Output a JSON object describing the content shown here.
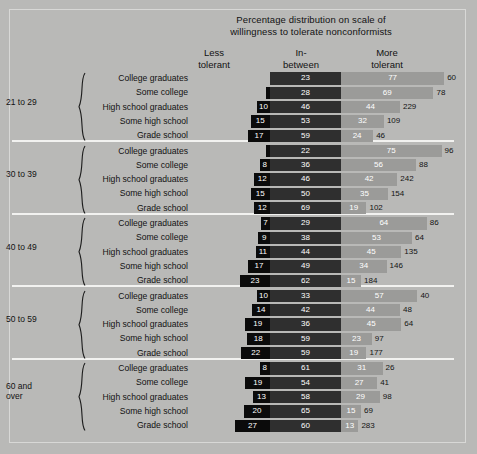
{
  "header": {
    "title_line1": "Percentage distribution on scale of",
    "title_line2": "willingness to tolerate nonconformists",
    "col_less_line1": "Less",
    "col_less_line2": "tolerant",
    "col_mid_line1": "In-",
    "col_mid_line2": "between",
    "col_more_line1": "More",
    "col_more_line2": "tolerant"
  },
  "colors": {
    "panel": "#b9b9b7",
    "less_tolerant": "#0b0b0b",
    "in_between": "#2f2f2f",
    "more_tolerant": "#9b9b99",
    "rule": "#f2f2f0"
  },
  "chart_data": {
    "type": "bar",
    "title": "Percentage distribution on scale of willingness to tolerate nonconformists",
    "xlabel": "",
    "ylabel": "",
    "grid": false,
    "legend_position": "top",
    "series": [
      {
        "name": "Less tolerant"
      },
      {
        "name": "In-between"
      },
      {
        "name": "More tolerant"
      }
    ],
    "groups": [
      {
        "age": "21 to 29",
        "age_line2": "",
        "rows": [
          {
            "education": "College graduates",
            "less": 0,
            "mid": 23,
            "more": 77,
            "n": 60,
            "less_label": ""
          },
          {
            "education": "Some college",
            "less": 3,
            "mid": 28,
            "more": 69,
            "n": 78,
            "less_label": ""
          },
          {
            "education": "High school graduates",
            "less": 10,
            "mid": 46,
            "more": 44,
            "n": 229,
            "less_label": "10"
          },
          {
            "education": "Some high school",
            "less": 15,
            "mid": 53,
            "more": 32,
            "n": 109,
            "less_label": "15"
          },
          {
            "education": "Grade school",
            "less": 17,
            "mid": 59,
            "more": 24,
            "n": 46,
            "less_label": "17"
          }
        ]
      },
      {
        "age": "30 to 39",
        "age_line2": "",
        "rows": [
          {
            "education": "College graduates",
            "less": 3,
            "mid": 22,
            "more": 75,
            "n": 96,
            "less_label": ""
          },
          {
            "education": "Some college",
            "less": 8,
            "mid": 36,
            "more": 56,
            "n": 88,
            "less_label": "8"
          },
          {
            "education": "High school graduates",
            "less": 12,
            "mid": 46,
            "more": 42,
            "n": 242,
            "less_label": "12"
          },
          {
            "education": "Some high school",
            "less": 15,
            "mid": 50,
            "more": 35,
            "n": 154,
            "less_label": "15"
          },
          {
            "education": "Grade school",
            "less": 12,
            "mid": 69,
            "more": 19,
            "n": 102,
            "less_label": "12"
          }
        ]
      },
      {
        "age": "40 to 49",
        "age_line2": "",
        "rows": [
          {
            "education": "College graduates",
            "less": 7,
            "mid": 29,
            "more": 64,
            "n": 86,
            "less_label": "7"
          },
          {
            "education": "Some college",
            "less": 9,
            "mid": 38,
            "more": 53,
            "n": 64,
            "less_label": "9"
          },
          {
            "education": "High school graduates",
            "less": 11,
            "mid": 44,
            "more": 45,
            "n": 135,
            "less_label": "11"
          },
          {
            "education": "Some high school",
            "less": 17,
            "mid": 49,
            "more": 34,
            "n": 146,
            "less_label": "17"
          },
          {
            "education": "Grade school",
            "less": 23,
            "mid": 62,
            "more": 15,
            "n": 184,
            "less_label": "23"
          }
        ]
      },
      {
        "age": "50 to 59",
        "age_line2": "",
        "rows": [
          {
            "education": "College graduates",
            "less": 10,
            "mid": 33,
            "more": 57,
            "n": 40,
            "less_label": "10"
          },
          {
            "education": "Some college",
            "less": 14,
            "mid": 42,
            "more": 44,
            "n": 48,
            "less_label": "14"
          },
          {
            "education": "High school graduates",
            "less": 19,
            "mid": 36,
            "more": 45,
            "n": 64,
            "less_label": "19"
          },
          {
            "education": "Some high school",
            "less": 18,
            "mid": 59,
            "more": 23,
            "n": 97,
            "less_label": "18"
          },
          {
            "education": "Grade school",
            "less": 22,
            "mid": 59,
            "more": 19,
            "n": 177,
            "less_label": "22"
          }
        ]
      },
      {
        "age": "60 and",
        "age_line2": "over",
        "rows": [
          {
            "education": "College graduates",
            "less": 8,
            "mid": 61,
            "more": 31,
            "n": 26,
            "less_label": "8"
          },
          {
            "education": "Some college",
            "less": 19,
            "mid": 54,
            "more": 27,
            "n": 41,
            "less_label": "19"
          },
          {
            "education": "High school graduates",
            "less": 13,
            "mid": 58,
            "more": 29,
            "n": 98,
            "less_label": "13"
          },
          {
            "education": "Some high school",
            "less": 20,
            "mid": 65,
            "more": 15,
            "n": 69,
            "less_label": "20"
          },
          {
            "education": "Grade school",
            "less": 27,
            "mid": 60,
            "more": 13,
            "n": 283,
            "less_label": "27"
          }
        ]
      }
    ]
  }
}
